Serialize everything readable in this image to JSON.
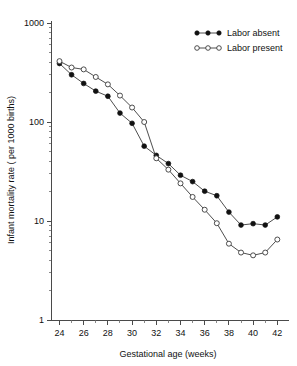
{
  "chart_data": {
    "type": "line",
    "title": "",
    "xlabel": "Gestational age (weeks)",
    "ylabel": "Infant mortality rate ( per 1000 births)",
    "xlim": [
      23.3,
      42.8
    ],
    "ylim": [
      1,
      1000
    ],
    "yscale": "log",
    "grid": false,
    "legend_position": "top-right",
    "x": [
      24,
      25,
      26,
      27,
      28,
      29,
      30,
      31,
      32,
      33,
      34,
      35,
      36,
      37,
      38,
      39,
      40,
      41,
      42
    ],
    "x_tick_labels": [
      "24",
      "26",
      "28",
      "30",
      "32",
      "34",
      "36",
      "38",
      "40",
      "42"
    ],
    "x_tick_values": [
      24,
      26,
      28,
      30,
      32,
      34,
      36,
      38,
      40,
      42
    ],
    "x_minor_ticks": [
      25,
      27,
      29,
      31,
      33,
      35,
      37,
      39,
      41
    ],
    "y_tick_labels": [
      "1000",
      "100",
      "10",
      "1"
    ],
    "y_tick_values": [
      1000,
      100,
      10,
      1
    ],
    "series": [
      {
        "name": "Labor absent",
        "marker": "filled-circle",
        "values": [
          390,
          300,
          245,
          205,
          182,
          123,
          97,
          57,
          46,
          38,
          29,
          25,
          20,
          18,
          12.3,
          9.1,
          9.4,
          9.1,
          11
        ]
      },
      {
        "name": "Labor present",
        "marker": "open-circle",
        "values": [
          412,
          355,
          340,
          285,
          240,
          185,
          140,
          100,
          43,
          33,
          24,
          17.5,
          13,
          9.5,
          5.9,
          4.8,
          4.5,
          4.8,
          6.5
        ]
      }
    ]
  },
  "legend": {
    "entries": [
      {
        "label": "Labor absent"
      },
      {
        "label": "Labor present"
      }
    ]
  },
  "colors": {
    "axis": "#4a4a4a",
    "line": "#3a3a3a",
    "filled_marker": "#111111",
    "open_marker_fill": "#ffffff",
    "background": "#ffffff"
  }
}
